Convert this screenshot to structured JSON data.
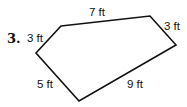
{
  "problem": {
    "number": "3.",
    "shape": "pentagon",
    "unit": "ft",
    "sides": [
      {
        "id": "top",
        "label": "7 ft",
        "length": 7
      },
      {
        "id": "upper-right",
        "label": "3 ft",
        "length": 3
      },
      {
        "id": "lower-right",
        "label": "9 ft",
        "length": 9
      },
      {
        "id": "lower-left",
        "label": "5 ft",
        "length": 5
      },
      {
        "id": "upper-left",
        "label": "3 ft",
        "length": 3
      }
    ],
    "vertices": [
      [
        61,
        26
      ],
      [
        150,
        16
      ],
      [
        176,
        45
      ],
      [
        79,
        101
      ],
      [
        36,
        53
      ]
    ],
    "stroke_color": "#111111"
  }
}
